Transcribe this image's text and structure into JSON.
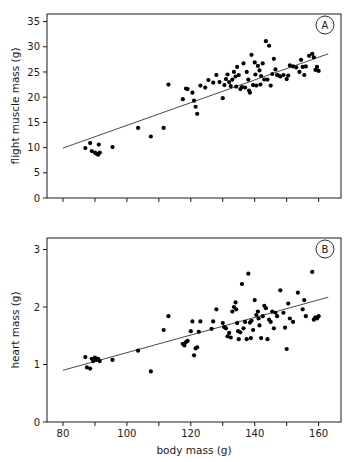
{
  "figure": {
    "background": "#ffffff",
    "ink": "#1a1a1a",
    "point_color": "#000000",
    "xlabel": "body mass (g)"
  },
  "chart_data": [
    {
      "type": "scatter",
      "panel": "A",
      "title": "",
      "xlabel": "body mass (g)",
      "ylabel": "flight muscle mass (g)",
      "xlim": [
        75,
        167
      ],
      "ylim": [
        0,
        36.5
      ],
      "xticks": [
        80,
        90,
        100,
        110,
        120,
        130,
        140,
        150,
        160
      ],
      "xticklabels": [
        "",
        "",
        "",
        "",
        "",
        "",
        "",
        "",
        ""
      ],
      "yticks": [
        0,
        5,
        10,
        15,
        20,
        25,
        30,
        35
      ],
      "yticklabels": [
        "0",
        "5",
        "10",
        "15",
        "20",
        "25",
        "30",
        "35"
      ],
      "grid": false,
      "legend": "none",
      "trendline": {
        "x": [
          80,
          163
        ],
        "y": [
          9.9,
          28.6
        ]
      },
      "x": [
        87.0,
        88.5,
        89.0,
        90.0,
        90.5,
        91.0,
        91.2,
        91.5,
        95.5,
        103.5,
        107.5,
        111.5,
        113.0,
        117.5,
        118.5,
        119.0,
        120.5,
        121.0,
        121.5,
        122.0,
        123.0,
        124.5,
        125.5,
        127.0,
        128.0,
        129.0,
        130.0,
        130.5,
        131.0,
        131.5,
        132.0,
        132.5,
        133.0,
        133.5,
        134.0,
        134.2,
        134.5,
        135.0,
        135.5,
        136.0,
        136.5,
        137.0,
        137.5,
        138.0,
        138.2,
        138.5,
        139.0,
        139.5,
        140.0,
        140.2,
        140.5,
        141.0,
        141.5,
        141.8,
        142.0,
        142.5,
        143.0,
        143.5,
        144.0,
        144.5,
        145.0,
        145.5,
        146.0,
        146.5,
        147.0,
        147.5,
        148.0,
        149.0,
        150.0,
        150.5,
        151.0,
        152.0,
        153.0,
        154.0,
        154.5,
        155.0,
        155.5,
        156.0,
        157.0,
        158.0,
        158.5,
        159.0,
        159.5,
        160.0
      ],
      "y": [
        9.9,
        10.9,
        9.3,
        9.0,
        8.8,
        8.6,
        10.6,
        9.0,
        10.1,
        13.9,
        12.2,
        13.9,
        22.5,
        19.6,
        21.7,
        21.6,
        20.9,
        19.3,
        18.1,
        16.7,
        22.3,
        21.9,
        23.4,
        22.9,
        24.4,
        23.0,
        19.8,
        22.4,
        23.6,
        24.5,
        23.0,
        22.2,
        23.5,
        25.0,
        24.1,
        22.1,
        26.0,
        24.4,
        21.6,
        22.0,
        26.7,
        21.9,
        25.0,
        23.5,
        21.3,
        20.9,
        28.4,
        22.4,
        26.9,
        24.5,
        22.3,
        26.2,
        25.3,
        22.5,
        24.2,
        26.7,
        23.5,
        31.1,
        23.5,
        30.2,
        22.3,
        24.6,
        27.6,
        25.5,
        24.4,
        24.3,
        24.1,
        24.4,
        23.6,
        24.3,
        26.3,
        26.1,
        25.9,
        25.0,
        27.4,
        26.0,
        24.4,
        26.1,
        28.2,
        28.6,
        27.9,
        25.4,
        26.0,
        25.2
      ]
    },
    {
      "type": "scatter",
      "panel": "B",
      "title": "",
      "xlabel": "body mass (g)",
      "ylabel": "heart mass (g)",
      "xlim": [
        75,
        167
      ],
      "ylim": [
        0,
        3.2
      ],
      "xticks": [
        80,
        90,
        100,
        110,
        120,
        130,
        140,
        150,
        160
      ],
      "xticklabels": [
        "80",
        "",
        "100",
        "",
        "120",
        "",
        "140",
        "",
        "160"
      ],
      "yticks": [
        0,
        1,
        2,
        3
      ],
      "yticklabels": [
        "0",
        "1",
        "2",
        "3"
      ],
      "grid": false,
      "legend": "none",
      "trendline": {
        "x": [
          80,
          163
        ],
        "y": [
          0.9,
          2.17
        ]
      },
      "x": [
        87.0,
        87.5,
        88.5,
        89.0,
        89.5,
        90.0,
        90.5,
        91.0,
        91.5,
        95.5,
        103.5,
        107.5,
        111.5,
        113.0,
        117.5,
        118.0,
        118.5,
        119.0,
        120.0,
        120.5,
        121.0,
        121.5,
        122.0,
        122.5,
        123.0,
        126.5,
        127.0,
        128.0,
        130.0,
        130.5,
        131.0,
        131.5,
        132.0,
        132.5,
        133.0,
        133.5,
        134.0,
        134.2,
        134.5,
        134.8,
        135.0,
        135.5,
        136.0,
        136.5,
        137.0,
        137.5,
        138.0,
        138.5,
        138.8,
        139.0,
        139.5,
        140.0,
        140.5,
        141.0,
        141.2,
        141.5,
        142.0,
        142.5,
        143.0,
        143.5,
        144.0,
        144.5,
        145.0,
        145.5,
        146.0,
        146.5,
        147.0,
        148.0,
        149.0,
        149.5,
        150.0,
        150.5,
        151.0,
        152.0,
        153.5,
        155.0,
        155.5,
        156.0,
        158.0,
        158.5,
        159.0,
        159.5,
        160.0
      ],
      "y": [
        1.13,
        0.95,
        0.93,
        1.1,
        1.06,
        1.12,
        1.08,
        1.1,
        1.06,
        1.08,
        1.24,
        0.88,
        1.6,
        1.84,
        1.36,
        1.33,
        1.39,
        1.41,
        1.58,
        1.75,
        1.16,
        1.28,
        1.3,
        1.57,
        1.75,
        1.62,
        1.75,
        1.96,
        1.72,
        1.65,
        1.63,
        1.49,
        1.55,
        1.47,
        1.92,
        2.0,
        2.08,
        1.96,
        1.72,
        1.58,
        1.44,
        1.56,
        2.4,
        1.63,
        1.74,
        1.44,
        2.58,
        1.73,
        1.46,
        1.76,
        1.6,
        2.12,
        1.86,
        1.92,
        1.8,
        1.68,
        1.46,
        1.84,
        2.02,
        1.98,
        1.44,
        1.78,
        1.74,
        1.92,
        1.63,
        1.9,
        1.84,
        2.29,
        1.9,
        1.64,
        1.27,
        2.06,
        1.8,
        1.74,
        2.25,
        1.96,
        2.12,
        1.84,
        2.61,
        1.78,
        1.82,
        1.8,
        1.84
      ]
    }
  ],
  "panels": {
    "a": {
      "letter": "A",
      "ylabel": "flight muscle mass (g)"
    },
    "b": {
      "letter": "B",
      "ylabel": "heart mass (g)"
    }
  }
}
